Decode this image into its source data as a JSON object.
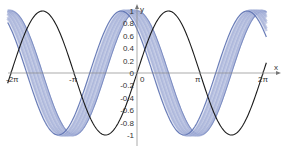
{
  "chart_data": {
    "type": "line",
    "title": "",
    "xlabel": "x",
    "ylabel": "y",
    "xlim": [
      -6.6,
      6.6
    ],
    "ylim": [
      -1.1,
      1.05
    ],
    "grid": false,
    "legend": null,
    "x_ticks": [
      "-2π",
      "-π",
      "0",
      "π",
      "2π"
    ],
    "x_tick_values": [
      -6.2832,
      -3.1416,
      0,
      3.1416,
      6.2832
    ],
    "y_ticks": [
      "-1",
      "-0.8",
      "-0.6",
      "-0.4",
      "-0.2",
      "0",
      "0.2",
      "0.4",
      "0.6",
      "0.8",
      "1"
    ],
    "y_tick_values": [
      -1,
      -0.8,
      -0.6,
      -0.4,
      -0.2,
      0,
      0.2,
      0.4,
      0.6,
      0.8,
      1
    ],
    "origin_label": "0",
    "series": [
      {
        "name": "sin(x)",
        "color": "#1a1a1a",
        "expression": "y = sin(x)",
        "phase": 0
      },
      {
        "name": "shifted sine family (band)",
        "color": "#5a6fb0",
        "expression": "y = sin(x + φ), φ estimated ≈ π/2 .. 3π/4 (approximate, read from the plot)",
        "phase_min": 1.5708,
        "phase_max": 2.3562,
        "count": 14
      }
    ]
  }
}
